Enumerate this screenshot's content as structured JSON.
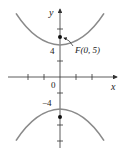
{
  "figure": {
    "type": "hyperbola",
    "equation": "y^2/16 - x^2/9 = 1",
    "axis_labels": {
      "x": "x",
      "y": "y"
    },
    "origin_label": "0",
    "tick_labels": {
      "y_pos": "4",
      "y_neg": "−4"
    },
    "focus_label": "F(0, 5)",
    "vertices": [
      [
        0,
        4
      ],
      [
        0,
        -4
      ]
    ],
    "foci": [
      [
        0,
        5
      ],
      [
        0,
        -5
      ]
    ],
    "x_ticks": [
      -4,
      -2,
      2,
      4
    ],
    "y_ticks": [
      -6,
      -4,
      -2,
      2,
      4,
      6
    ],
    "colors": {
      "curve": "#8a8a8a",
      "axis": "#333333",
      "point": "#111111"
    }
  }
}
